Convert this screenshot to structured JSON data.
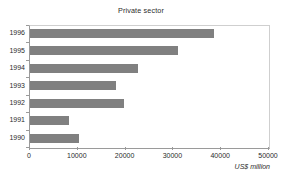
{
  "chart_data": {
    "type": "bar",
    "orientation": "horizontal",
    "title": "Private sector",
    "xlabel": "US$ million",
    "ylabel": "",
    "categories": [
      "1996",
      "1995",
      "1994",
      "1993",
      "1992",
      "1991",
      "1990"
    ],
    "values": [
      38500,
      31000,
      22600,
      18000,
      19700,
      8200,
      10200
    ],
    "xlim": [
      0,
      50000
    ],
    "xticks": [
      0,
      10000,
      20000,
      30000,
      40000,
      50000
    ],
    "xtick_labels": [
      "0",
      "10000",
      "20000",
      "30000",
      "40000",
      "50000"
    ],
    "grid": false,
    "legend": null,
    "bar_color": "#808080",
    "axis_color": "#9a9a9a",
    "frame_color": "#cfcfcf",
    "text_color": "#2b2b2b"
  }
}
